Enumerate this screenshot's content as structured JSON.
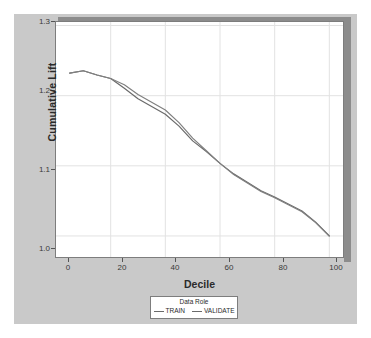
{
  "chart_data": {
    "type": "line",
    "title": "",
    "xlabel": "Decile",
    "ylabel": "Cumulative Lift",
    "xlim": [
      0,
      105
    ],
    "ylim": [
      0.97,
      1.305
    ],
    "xticks": [
      "0",
      "20",
      "40",
      "60",
      "80",
      "100"
    ],
    "xtick_values": [
      0,
      20,
      40,
      60,
      80,
      100
    ],
    "yticks": [
      "1.0",
      "1.1",
      "1.2",
      "1.3"
    ],
    "ytick_values": [
      1.0,
      1.1,
      1.2,
      1.3
    ],
    "grid": true,
    "grid_color": "#e2e2e2",
    "legend_position": "bottom-center",
    "legend_title": "Data Role",
    "x": [
      5,
      10,
      15,
      20,
      25,
      30,
      35,
      40,
      45,
      50,
      55,
      60,
      65,
      70,
      75,
      80,
      85,
      90,
      95,
      100
    ],
    "series": [
      {
        "name": "TRAIN",
        "color": "#6a6a6a",
        "values": [
          1.232,
          1.2355,
          1.2295,
          1.2245,
          1.2105,
          1.1955,
          1.1845,
          1.1735,
          1.1565,
          1.1355,
          1.1205,
          1.1035,
          1.0885,
          1.0765,
          1.0645,
          1.0555,
          1.0455,
          1.0355,
          1.0195,
          1.0
        ]
      },
      {
        "name": "VALIDATE",
        "color": "#808080",
        "values": [
          1.232,
          1.2355,
          1.2295,
          1.2245,
          1.2155,
          1.2015,
          1.1905,
          1.1795,
          1.1615,
          1.1395,
          1.1215,
          1.1035,
          1.0875,
          1.0755,
          1.0635,
          1.0545,
          1.0445,
          1.0345,
          1.019,
          1.0
        ]
      }
    ]
  },
  "legend": {
    "title": "Data Role",
    "entries": [
      {
        "label": "TRAIN"
      },
      {
        "label": "VALIDATE"
      }
    ]
  },
  "axes": {
    "x_title": "Decile",
    "y_title": "Cumulative Lift"
  }
}
